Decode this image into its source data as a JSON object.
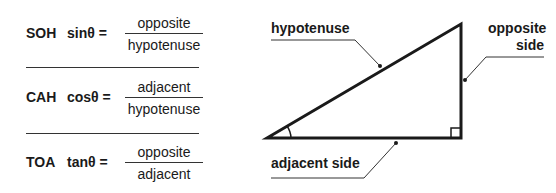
{
  "formulas": [
    {
      "mnemonic": "SOH",
      "function": "sinθ =",
      "numerator": "opposite",
      "denominator": "hypotenuse"
    },
    {
      "mnemonic": "CAH",
      "function": "cosθ =",
      "numerator": "adjacent",
      "denominator": "hypotenuse"
    },
    {
      "mnemonic": "TOA",
      "function": "tanθ =",
      "numerator": "opposite",
      "denominator": "adjacent"
    }
  ],
  "triangle": {
    "labels": {
      "hypotenuse": "hypotenuse",
      "opposite_line1": "opposite",
      "opposite_line2": "side",
      "adjacent": "adjacent side"
    },
    "stroke_color": "#1a1a1a"
  }
}
